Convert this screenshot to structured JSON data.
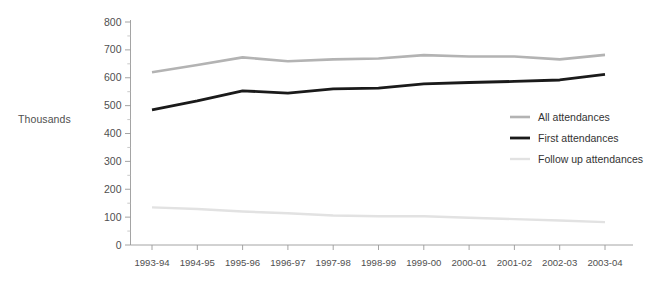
{
  "chart_data": {
    "type": "line",
    "title": "",
    "subtitle": "",
    "xlabel": "",
    "ylabel": "Thousands",
    "categories": [
      "1993-94",
      "1994-95",
      "1995-96",
      "1996-97",
      "1997-98",
      "1998-99",
      "1999-00",
      "2000-01",
      "2001-02",
      "2002-03",
      "2003-04"
    ],
    "ylim": [
      0,
      800
    ],
    "ytick_labels": [
      "0",
      "100",
      "200",
      "300",
      "400",
      "500",
      "600",
      "700",
      "800"
    ],
    "ytick_values": [
      0,
      100,
      200,
      300,
      400,
      500,
      600,
      700,
      800
    ],
    "grid": false,
    "legend_position": "inside-right",
    "series": [
      {
        "name": "All attendances",
        "color": "#b3b3b3",
        "width": 2.6,
        "values": [
          620,
          646,
          673,
          659,
          666,
          669,
          681,
          676,
          676,
          666,
          682
        ]
      },
      {
        "name": "First attendances",
        "color": "#1a1a1a",
        "width": 2.8,
        "values": [
          485,
          517,
          553,
          545,
          560,
          563,
          578,
          583,
          587,
          592,
          612
        ]
      },
      {
        "name": "Follow up attendances",
        "color": "#e2e2e2",
        "width": 2.4,
        "values": [
          135,
          129,
          120,
          114,
          106,
          103,
          103,
          98,
          93,
          88,
          82
        ]
      }
    ]
  },
  "legend": {
    "entries": [
      {
        "label": "All attendances"
      },
      {
        "label": "First attendances"
      },
      {
        "label": "Follow up attendances"
      }
    ]
  },
  "colors": {
    "background": "#ffffff",
    "axis": "#9a9a9a",
    "text": "#4f4f4f",
    "all_attendances": "#b3b3b3",
    "first_attendances": "#1a1a1a",
    "follow_up_attendances": "#e2e2e2"
  }
}
